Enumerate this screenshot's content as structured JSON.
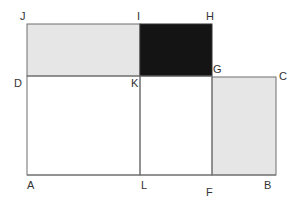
{
  "diagram": {
    "colors": {
      "stroke": "#6f6f6f",
      "light_fill": "#e6e6e6",
      "dark_fill": "#141414",
      "label": "#333333"
    },
    "labels": {
      "J": "J",
      "I": "I",
      "H": "H",
      "D": "D",
      "K": "K",
      "G": "G",
      "C": "C",
      "A": "A",
      "L": "L",
      "F": "F",
      "B": "B"
    },
    "regions": [
      {
        "name": "rect-JIKD",
        "fill": "light"
      },
      {
        "name": "rect-IHGK",
        "fill": "dark"
      },
      {
        "name": "rect-GCBF",
        "fill": "light"
      },
      {
        "name": "rect-DKLA",
        "fill": "none"
      },
      {
        "name": "rect-KGFL",
        "fill": "none"
      }
    ]
  }
}
